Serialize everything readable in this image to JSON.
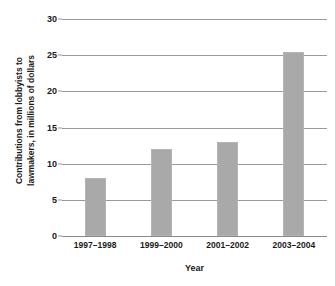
{
  "chart_data": {
    "type": "bar",
    "title": "",
    "categories": [
      "1997–1998",
      "1999–2000",
      "2001–2002",
      "2003–2004"
    ],
    "values": [
      8,
      12,
      13,
      25.4
    ],
    "xlabel": "Year",
    "ylabel": "Contributions from lobbyists to lawmakers, in millions of dollars",
    "ylabel_lines": [
      "Contributions from lobbyists to",
      "lawmakers, in millions of dollars"
    ],
    "ylim": [
      0,
      30
    ],
    "ytick_values": [
      0,
      5,
      10,
      15,
      20,
      25,
      30
    ],
    "ytick_labels": [
      "0",
      "5",
      "10",
      "15",
      "20",
      "25",
      "30"
    ],
    "grid": true,
    "legend": false,
    "legend_position": "none",
    "bar_color": "#a9a9a9",
    "gridline_color": "#9a9a9a",
    "background_color": "#ffffff",
    "text_color": "#1a1a1a"
  }
}
